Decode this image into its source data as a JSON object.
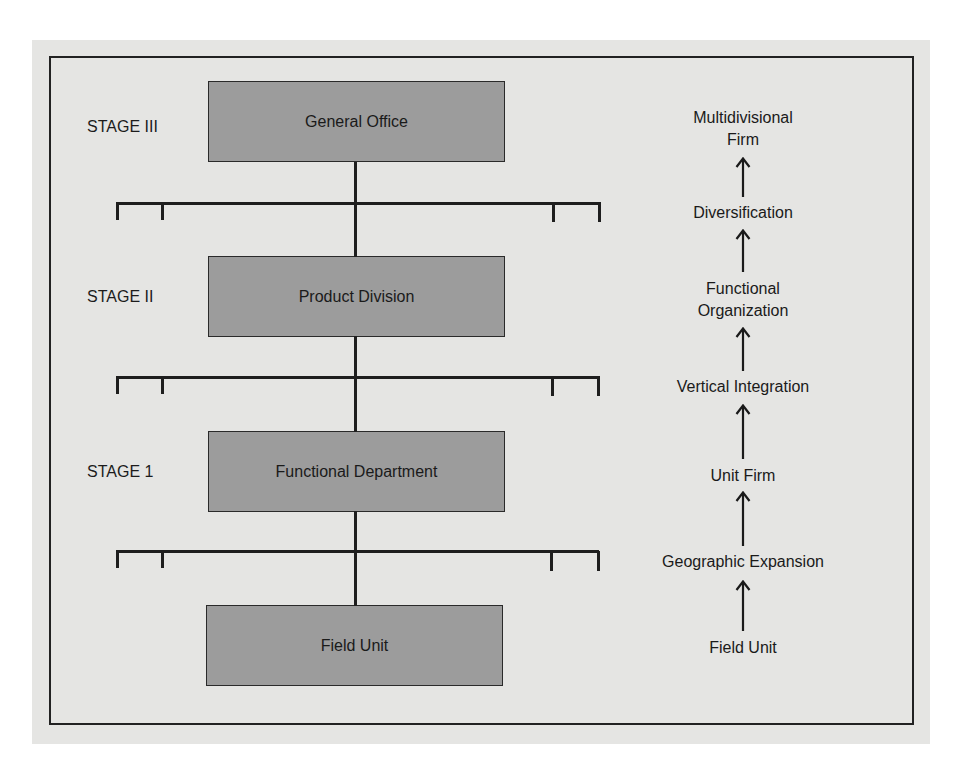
{
  "diagram": {
    "colors": {
      "background": "#e5e5e3",
      "box_fill": "#9c9c9c",
      "line": "#1e1e1e",
      "text": "#1a1a1a"
    },
    "stages": [
      {
        "label": "STAGE III",
        "box": "General Office"
      },
      {
        "label": "STAGE II",
        "box": "Product Division"
      },
      {
        "label": "STAGE 1",
        "box": "Functional Department"
      },
      {
        "label": "",
        "box": "Field Unit"
      }
    ],
    "progression": [
      {
        "lines": [
          "Multidivisional",
          "Firm"
        ]
      },
      {
        "lines": [
          "Diversification"
        ]
      },
      {
        "lines": [
          "Functional",
          "Organization"
        ]
      },
      {
        "lines": [
          "Vertical Integration"
        ]
      },
      {
        "lines": [
          "Unit Firm"
        ]
      },
      {
        "lines": [
          "Geographic Expansion"
        ]
      },
      {
        "lines": [
          "Field Unit"
        ]
      }
    ]
  }
}
